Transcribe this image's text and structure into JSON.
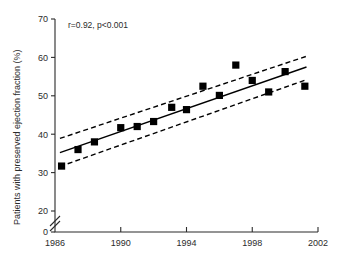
{
  "chart_data": {
    "type": "scatter",
    "title": "",
    "xlabel": "",
    "ylabel": "Patients with preserved ejection fraction (%)",
    "annotation": "r=0.92, p<0.001",
    "xlim": [
      1986,
      2002
    ],
    "ylim": [
      0,
      70
    ],
    "y_axis_break": true,
    "y_break_between": [
      0,
      20
    ],
    "grid": false,
    "legend": "none",
    "xticks": [
      1986,
      1990,
      1994,
      1998,
      2002
    ],
    "xtick_labels": [
      "1986",
      "1990",
      "1994",
      "1998",
      "2002"
    ],
    "yticks": [
      0,
      20,
      30,
      40,
      50,
      60,
      70
    ],
    "ytick_labels": [
      "0",
      "20",
      "30",
      "40",
      "50",
      "60",
      "70"
    ],
    "x": [
      1986.4,
      1987.4,
      1988.4,
      1990.0,
      1991.0,
      1992.0,
      1993.1,
      1994.0,
      1995.0,
      1996.0,
      1997.0,
      1998.0,
      1999.0,
      2000.0,
      2001.2
    ],
    "values": [
      31.7,
      36.0,
      38.0,
      41.7,
      42.0,
      43.3,
      47.0,
      46.4,
      52.5,
      50.1,
      58.0,
      54.0,
      51.0,
      56.3,
      52.5
    ],
    "marker": "filled-square",
    "marker_color": "#000000",
    "series": [
      {
        "name": "Patients with preserved ejection fraction",
        "x": [
          1986.4,
          1987.4,
          1988.4,
          1990.0,
          1991.0,
          1992.0,
          1993.1,
          1994.0,
          1995.0,
          1996.0,
          1997.0,
          1998.0,
          1999.0,
          2000.0,
          2001.2
        ],
        "values": [
          31.7,
          36.0,
          38.0,
          41.7,
          42.0,
          43.3,
          47.0,
          46.4,
          52.5,
          50.1,
          58.0,
          54.0,
          51.0,
          56.3,
          52.5
        ]
      }
    ],
    "regression_line": {
      "name": "fit",
      "style": "solid",
      "x": [
        1986.3,
        2001.3
      ],
      "y": [
        35.2,
        57.5
      ]
    },
    "confidence_bands": [
      {
        "name": "upper-ci",
        "style": "dashed",
        "x": [
          1986.3,
          2001.3
        ],
        "y": [
          38.9,
          60.3
        ]
      },
      {
        "name": "lower-ci",
        "style": "dashed",
        "x": [
          1986.3,
          2001.3
        ],
        "y": [
          31.6,
          54.2
        ]
      }
    ]
  }
}
